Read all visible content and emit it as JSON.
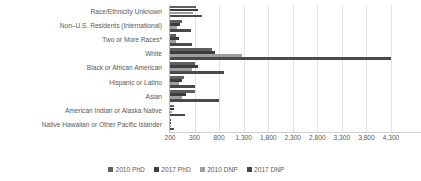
{
  "chart_data": {
    "type": "bar",
    "orientation": "horizontal",
    "title": "",
    "xlabel": "",
    "ylabel": "",
    "grid": true,
    "legend_position": "bottom",
    "xlim": [
      200,
      4300
    ],
    "xticks": [
      200,
      300,
      800,
      1300,
      1800,
      2300,
      2800,
      3300,
      3800,
      4300
    ],
    "xtick_labels": [
      "200",
      "300",
      "800",
      "1,300",
      "1,800",
      "2,300",
      "2,800",
      "3,300",
      "3,800",
      "4,300"
    ],
    "categories": [
      "Race/Ethnicity Unknown",
      "Non–U.S. Residents (International)",
      "Two or More Races*",
      "White",
      "Black or African American",
      "Hispanic or Latino",
      "Asian",
      "American Indian or Alaska Native",
      "Native Hawaiian or Other Pacific Islander"
    ],
    "series": [
      {
        "name": "2010 PhD",
        "color": "#5f5f5f",
        "values": [
          335,
          250,
          225,
          660,
          315,
          255,
          300,
          215,
          205
        ]
      },
      {
        "name": "2017 PhD",
        "color": "#3d3d3d",
        "values": [
          360,
          240,
          235,
          715,
          360,
          250,
          265,
          215,
          205
        ]
      },
      {
        "name": "2010 DNP",
        "color": "#9e9e9e",
        "values": [
          295,
          230,
          225,
          1260,
          290,
          235,
          250,
          210,
          205
        ]
      },
      {
        "name": "2017 DNP",
        "color": "#4a4a4a",
        "values": [
          455,
          285,
          290,
          4290,
          900,
          310,
          800,
          260,
          215
        ]
      }
    ]
  },
  "legend": {
    "items": [
      {
        "label": "2010 PhD",
        "color": "#5f5f5f"
      },
      {
        "label": "2017 PhD",
        "color": "#3d3d3d"
      },
      {
        "label": "2010 DNP",
        "color": "#9e9e9e"
      },
      {
        "label": "2017 DNP",
        "color": "#4a4a4a"
      }
    ]
  }
}
